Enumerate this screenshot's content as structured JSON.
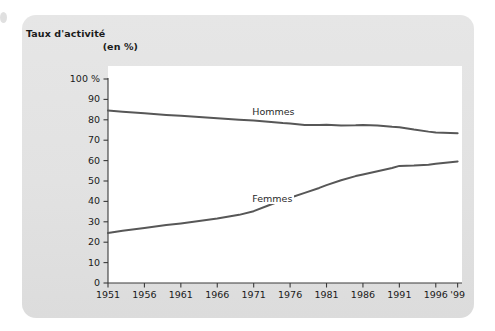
{
  "panel": {
    "background_color": "#e3e3e3",
    "plot_background_color": "#ffffff"
  },
  "title": {
    "line1": "Taux d'activité",
    "line2": "(en %)"
  },
  "chart_data": {
    "type": "line",
    "title": "Taux d'activité (en %)",
    "xlabel": "",
    "ylabel": "Taux d'activité (en %)",
    "ylim": [
      0,
      100
    ],
    "xlim": [
      1951,
      1999
    ],
    "grid": false,
    "legend": "inline-labels",
    "y_ticks": [
      "0",
      "10",
      "20",
      "30",
      "40",
      "50",
      "60",
      "70",
      "80",
      "90",
      "100 %"
    ],
    "y_tick_values": [
      0,
      10,
      20,
      30,
      40,
      50,
      60,
      70,
      80,
      90,
      100
    ],
    "x_ticks": [
      "1951",
      "1956",
      "1961",
      "1966",
      "1971",
      "1976",
      "1981",
      "1986",
      "1991",
      "1996",
      "'99"
    ],
    "x_tick_values": [
      1951,
      1956,
      1961,
      1966,
      1971,
      1976,
      1981,
      1986,
      1991,
      1996,
      1999
    ],
    "line_color": "#575757",
    "series": [
      {
        "name": "Hommes",
        "color": "#575757",
        "x": [
          1951,
          1953,
          1956,
          1959,
          1961,
          1964,
          1966,
          1969,
          1971,
          1973,
          1975,
          1976,
          1978,
          1980,
          1981,
          1983,
          1985,
          1986,
          1988,
          1990,
          1991,
          1993,
          1995,
          1996,
          1998,
          1999
        ],
        "values": [
          84.5,
          84.0,
          83.2,
          82.4,
          82.0,
          81.2,
          80.7,
          80.0,
          79.6,
          79.0,
          78.4,
          78.2,
          77.5,
          77.4,
          77.6,
          77.2,
          77.3,
          77.5,
          77.2,
          76.6,
          76.4,
          75.2,
          74.2,
          73.8,
          73.5,
          73.4
        ]
      },
      {
        "name": "Femmes",
        "color": "#575757",
        "x": [
          1951,
          1953,
          1956,
          1959,
          1961,
          1964,
          1966,
          1969,
          1971,
          1973,
          1975,
          1976,
          1978,
          1980,
          1981,
          1983,
          1985,
          1986,
          1988,
          1990,
          1991,
          1993,
          1995,
          1996,
          1998,
          1999
        ],
        "values": [
          24.5,
          25.6,
          27.0,
          28.4,
          29.2,
          30.6,
          31.6,
          33.4,
          35.2,
          38.0,
          40.6,
          41.8,
          44.2,
          46.6,
          48.0,
          50.4,
          52.4,
          53.2,
          54.8,
          56.4,
          57.4,
          57.6,
          58.0,
          58.4,
          59.2,
          59.6
        ]
      }
    ],
    "annotations": [
      {
        "text": "Hommes",
        "x": 1973,
        "y": 84.0
      },
      {
        "text": "Femmes",
        "x": 1973,
        "y": 41.0
      }
    ]
  }
}
